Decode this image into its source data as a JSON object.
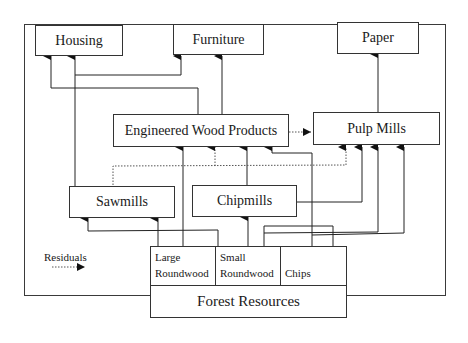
{
  "diagram": {
    "nodes": {
      "housing": "Housing",
      "furniture": "Furniture",
      "paper": "Paper",
      "engineered_wood": "Engineered Wood Products",
      "pulp_mills": "Pulp Mills",
      "sawmills": "Sawmills",
      "chipmills": "Chipmills",
      "forest_resources": "Forest Resources",
      "large_roundwood_1": "Large",
      "large_roundwood_2": "Roundwood",
      "small_roundwood_1": "Small",
      "small_roundwood_2": "Roundwood",
      "chips": "Chips"
    },
    "legend": {
      "residuals_label": "Residuals",
      "residuals_style": "dotted arrow"
    },
    "edges": [
      {
        "from": "Large Roundwood",
        "to": "Sawmills",
        "style": "solid"
      },
      {
        "from": "Large Roundwood",
        "to": "Engineered Wood Products",
        "style": "solid"
      },
      {
        "from": "Small Roundwood",
        "to": "Sawmills",
        "style": "solid"
      },
      {
        "from": "Small Roundwood",
        "to": "Chipmills",
        "style": "solid"
      },
      {
        "from": "Small Roundwood",
        "to": "Pulp Mills",
        "style": "solid"
      },
      {
        "from": "Chips",
        "to": "Pulp Mills",
        "style": "solid"
      },
      {
        "from": "Chips",
        "to": "Engineered Wood Products",
        "style": "solid"
      },
      {
        "from": "Sawmills",
        "to": "Housing",
        "style": "solid"
      },
      {
        "from": "Sawmills",
        "to": "Furniture",
        "style": "solid"
      },
      {
        "from": "Sawmills",
        "to": "Engineered Wood Products",
        "style": "dotted"
      },
      {
        "from": "Sawmills",
        "to": "Pulp Mills",
        "style": "dotted"
      },
      {
        "from": "Chipmills",
        "to": "Engineered Wood Products",
        "style": "solid"
      },
      {
        "from": "Chipmills",
        "to": "Pulp Mills",
        "style": "solid"
      },
      {
        "from": "Engineered Wood Products",
        "to": "Housing",
        "style": "solid"
      },
      {
        "from": "Engineered Wood Products",
        "to": "Furniture",
        "style": "solid"
      },
      {
        "from": "Engineered Wood Products",
        "to": "Pulp Mills",
        "style": "dotted"
      },
      {
        "from": "Pulp Mills",
        "to": "Paper",
        "style": "solid"
      }
    ]
  }
}
